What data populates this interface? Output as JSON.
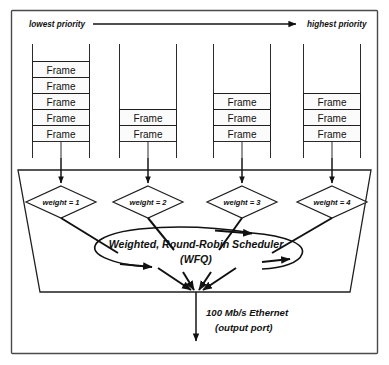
{
  "figure": {
    "priority_axis": {
      "left_label": "lowest priority",
      "right_label": "highest priority"
    },
    "frame_label": "Frame",
    "queues": [
      {
        "id": "queue-1",
        "weight_label": "weight = 1",
        "frame_count": 5
      },
      {
        "id": "queue-2",
        "weight_label": "weight = 2",
        "frame_count": 2
      },
      {
        "id": "queue-3",
        "weight_label": "weight = 3",
        "frame_count": 3
      },
      {
        "id": "queue-4",
        "weight_label": "weight = 4",
        "frame_count": 3
      }
    ],
    "scheduler": {
      "line1": "Weighted, Round-Robin Scheduler",
      "line2": "(WFQ)"
    },
    "output": {
      "line1": "100 Mb/s Ethernet",
      "line2": "(output port)"
    },
    "colors": {
      "ink": "#111111",
      "border": "#4a4a4a",
      "background": "#ffffff"
    }
  }
}
